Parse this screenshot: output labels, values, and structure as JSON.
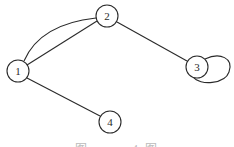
{
  "graph": {
    "nodes": [
      {
        "id": "1",
        "label": "1",
        "x": 18,
        "y": 71
      },
      {
        "id": "2",
        "label": "2",
        "x": 107,
        "y": 16
      },
      {
        "id": "3",
        "label": "3",
        "x": 197,
        "y": 67
      },
      {
        "id": "4",
        "label": "4",
        "x": 110,
        "y": 122
      }
    ],
    "edges": [
      {
        "from": "1",
        "to": "2",
        "type": "straight"
      },
      {
        "from": "1",
        "to": "2",
        "type": "curved"
      },
      {
        "from": "2",
        "to": "3",
        "type": "straight"
      },
      {
        "from": "1",
        "to": "4",
        "type": "straight"
      },
      {
        "from": "3",
        "to": "3",
        "type": "self-loop"
      }
    ],
    "node_radius": 11,
    "stroke_color": "#2a2a2a"
  },
  "caption": {
    "text": "图 … … 4 图"
  }
}
